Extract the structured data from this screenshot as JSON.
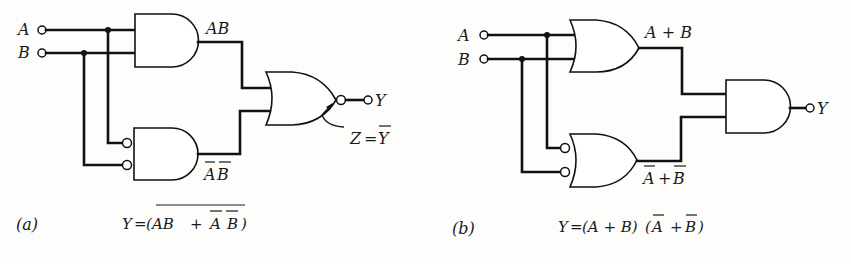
{
  "figure_a": {
    "caption": "(a)",
    "inputs": [
      {
        "name": "A"
      },
      {
        "name": "B"
      }
    ],
    "gates": [
      {
        "id": "and1",
        "type": "AND",
        "inputs": [
          "A",
          "B"
        ],
        "output_label": "AB"
      },
      {
        "id": "and2",
        "type": "AND",
        "inverted_inputs": true,
        "inputs": [
          "A",
          "B"
        ],
        "output_label_base": "AB",
        "output_label": "A̅B̅"
      },
      {
        "id": "nor",
        "type": "NOR",
        "inputs": [
          "AB",
          "A̅B̅"
        ],
        "output": "Y"
      }
    ],
    "label_ab": "AB",
    "label_abbar_a": "A",
    "label_abbar_b": "B",
    "output_label": "Y",
    "annotation": {
      "z": "Z",
      "eq": "=",
      "ybar": "Y"
    },
    "equation": {
      "lhs": "Y",
      "eq": "=",
      "open": "(",
      "ab": "AB",
      "plus": "+",
      "abar": "A",
      "bbar": "B",
      "close": ")",
      "text": "Y = (AB + A̅B̅)‾"
    }
  },
  "figure_b": {
    "caption": "(b)",
    "inputs": [
      {
        "name": "A"
      },
      {
        "name": "B"
      }
    ],
    "gates": [
      {
        "id": "or1",
        "type": "OR",
        "inputs": [
          "A",
          "B"
        ],
        "output_label": "A+B"
      },
      {
        "id": "or2",
        "type": "OR",
        "inverted_inputs": true,
        "inputs": [
          "A",
          "B"
        ],
        "output_label": "A̅+B̅"
      },
      {
        "id": "and",
        "type": "AND",
        "inputs": [
          "A+B",
          "A̅+B̅"
        ],
        "output": "Y"
      }
    ],
    "label_apb": "A + B",
    "label_nanb_a": "A",
    "label_nanb_plus": "+",
    "label_nanb_b": "B",
    "output_label": "Y",
    "equation": {
      "lhs": "Y",
      "eq": "=",
      "part1": "(A + B)",
      "open": "(",
      "abar": "A",
      "plus": "+",
      "bbar": "B",
      "close": ")",
      "text": "Y = (A + B)(A̅ + B̅)"
    }
  }
}
